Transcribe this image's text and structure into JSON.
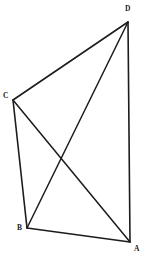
{
  "figure": {
    "background_color": "#ffffff",
    "stroke_color": "#1c1c1c",
    "label_color": "#1c1c1c",
    "vertices": [
      {
        "id": "A",
        "label": "A",
        "x": 130,
        "y": 242,
        "label_x": 134,
        "label_y": 245
      },
      {
        "id": "B",
        "label": "B",
        "x": 27,
        "y": 228,
        "label_x": 17,
        "label_y": 224
      },
      {
        "id": "C",
        "label": "C",
        "x": 13,
        "y": 100,
        "label_x": 3,
        "label_y": 92
      },
      {
        "id": "D",
        "label": "D",
        "x": 128,
        "y": 22,
        "label_x": 125,
        "label_y": 5
      }
    ],
    "edges": [
      {
        "id": "CD",
        "from": "C",
        "to": "D",
        "kind": "side",
        "width": 1.6
      },
      {
        "id": "DA",
        "from": "D",
        "to": "A",
        "kind": "side",
        "width": 1.6
      },
      {
        "id": "AB",
        "from": "A",
        "to": "B",
        "kind": "side",
        "width": 1.6
      },
      {
        "id": "BC",
        "from": "B",
        "to": "C",
        "kind": "side",
        "width": 1.6
      },
      {
        "id": "CA",
        "from": "C",
        "to": "A",
        "kind": "diagonal",
        "width": 1.5
      },
      {
        "id": "DB",
        "from": "D",
        "to": "B",
        "kind": "diagonal",
        "width": 1.5
      }
    ],
    "intersection": {
      "id": "diagonal-crossing",
      "x": 61,
      "y": 160
    }
  }
}
